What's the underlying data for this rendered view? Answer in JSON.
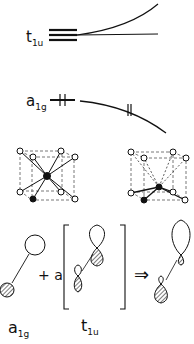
{
  "levels": {
    "upper": {
      "main": "t",
      "sub": "1u"
    },
    "lower": {
      "main": "a",
      "sub": "1g"
    }
  },
  "equation": {
    "plus_a": "+ a",
    "arrow": "⇒"
  },
  "bottom_labels": {
    "left": {
      "main": "a",
      "sub": "1g"
    },
    "right": {
      "main": "t",
      "sub": "1u"
    }
  }
}
